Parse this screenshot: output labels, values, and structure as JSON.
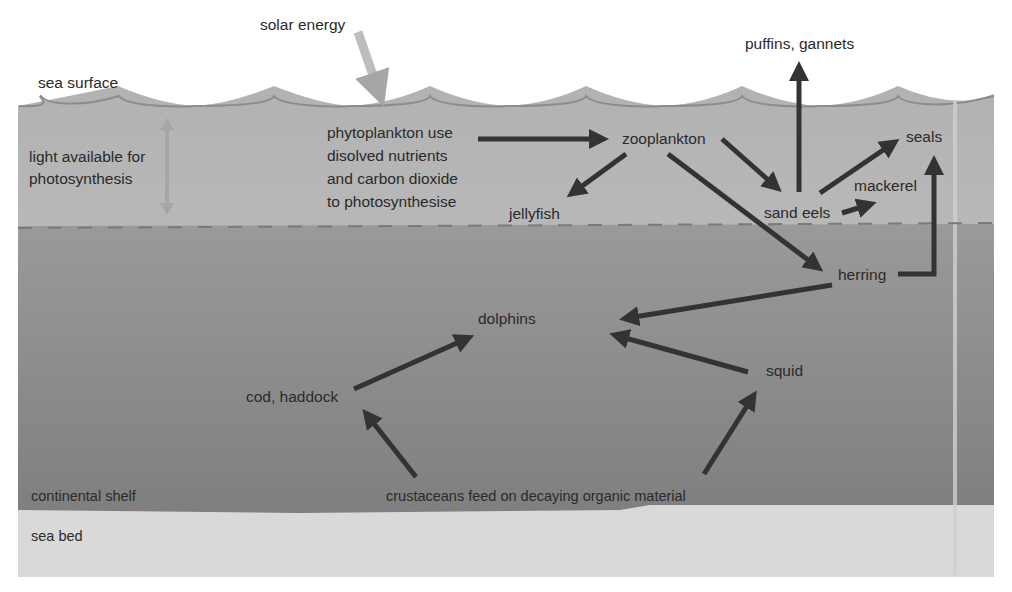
{
  "colors": {
    "background": "#ffffff",
    "upper_water": "#b4b4b4",
    "lower_water_top": "#9a9a9a",
    "lower_water_bottom": "#828282",
    "sea_bed": "#d8d8d8",
    "surface_line": "#8a8a8a",
    "arrow": "#333333",
    "solar_arrow": "#bdbdbd",
    "light_arrow": "#a6a6a6",
    "dashed_line": "#7a7a7a",
    "text": "#2a2a2a"
  },
  "zones": {
    "sea_surface": "sea surface",
    "light_zone": [
      "light available for",
      "photosynthesis"
    ],
    "continental_shelf": "continental shelf",
    "sea_bed": "sea bed"
  },
  "energy": {
    "solar": "solar energy"
  },
  "nodes": {
    "phytoplankton": [
      "phytoplankton use",
      "disolved nutrients",
      "and carbon dioxide",
      "to photosynthesise"
    ],
    "zooplankton": "zooplankton",
    "jellyfish": "jellyfish",
    "sand_eels": "sand eels",
    "puffins_gannets": "puffins, gannets",
    "seals": "seals",
    "mackerel": "mackerel",
    "herring": "herring",
    "dolphins": "dolphins",
    "cod_haddock": "cod, haddock",
    "squid": "squid",
    "crustaceans": "crustaceans feed on decaying organic material"
  },
  "edges": [
    {
      "from": "phytoplankton",
      "to": "zooplankton"
    },
    {
      "from": "zooplankton",
      "to": "jellyfish"
    },
    {
      "from": "zooplankton",
      "to": "sand_eels"
    },
    {
      "from": "zooplankton",
      "to": "herring"
    },
    {
      "from": "sand_eels",
      "to": "puffins_gannets"
    },
    {
      "from": "sand_eels",
      "to": "seals"
    },
    {
      "from": "sand_eels",
      "to": "mackerel"
    },
    {
      "from": "herring",
      "to": "seals"
    },
    {
      "from": "herring",
      "to": "dolphins"
    },
    {
      "from": "cod_haddock",
      "to": "dolphins"
    },
    {
      "from": "squid",
      "to": "dolphins"
    },
    {
      "from": "crustaceans",
      "to": "cod_haddock"
    },
    {
      "from": "crustaceans",
      "to": "squid"
    }
  ]
}
